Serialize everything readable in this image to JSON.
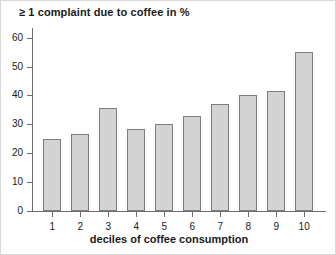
{
  "chart_data": {
    "type": "bar",
    "title": "≥ 1 complaint due to coffee in %",
    "xlabel": "deciles of coffee consumption",
    "ylabel": "",
    "categories": [
      "1",
      "2",
      "3",
      "4",
      "5",
      "6",
      "7",
      "8",
      "9",
      "10"
    ],
    "values": [
      25,
      26.5,
      35.5,
      28.5,
      30,
      33,
      37,
      40,
      41.5,
      55
    ],
    "ylim": [
      0,
      63
    ],
    "yticks": [
      0,
      10,
      20,
      30,
      40,
      50,
      60
    ],
    "ytick_labels": [
      "0",
      "10",
      "20",
      "30",
      "40",
      "50",
      "60"
    ],
    "grid": false,
    "legend": false,
    "bar_fill_color": "#d3d3d3",
    "bar_edge_color": "#7d7d7d",
    "axis_color": "#6e6e6e",
    "text_color": "#1a1a1a",
    "background_color": "#ffffff"
  }
}
